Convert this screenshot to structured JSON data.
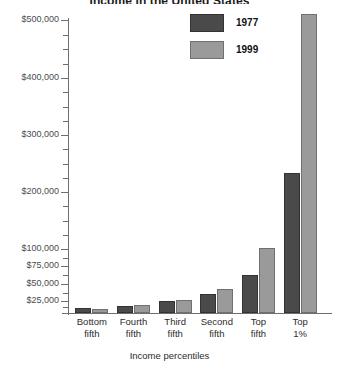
{
  "chart_data": {
    "type": "bar",
    "title": "Income in the United States",
    "xlabel": "Income percentiles",
    "ylabel": "",
    "categories": [
      "Bottom fifth",
      "Fourth fifth",
      "Third fifth",
      "Second fifth",
      "Top fifth",
      "Top 1%"
    ],
    "category_lines": [
      [
        "Bottom",
        "fifth"
      ],
      [
        "Fourth",
        "fifth"
      ],
      [
        "Third",
        "fifth"
      ],
      [
        "Second",
        "fifth"
      ],
      [
        "Top",
        "fifth"
      ],
      [
        "Top",
        "1%"
      ]
    ],
    "series": [
      {
        "name": "1977",
        "color": "#4a4a4a",
        "values": [
          10000,
          15000,
          24000,
          35000,
          63000,
          234000
        ]
      },
      {
        "name": "1999",
        "color": "#9a9a9a",
        "values": [
          9000,
          17000,
          26000,
          43000,
          102000,
          511000
        ]
      }
    ],
    "ytick_labels": [
      "$25,000",
      "$50,000",
      "$75,000",
      "$100,000",
      "$200,000",
      "$300,000",
      "$400,000",
      "$500,000"
    ],
    "ytick_values": [
      25000,
      50000,
      75000,
      100000,
      200000,
      300000,
      400000,
      500000
    ],
    "axis_note": "non-linear broken y-axis: compressed below $100,000",
    "ylim": [
      0,
      520000
    ],
    "grid": false,
    "legend_position": "top-center"
  },
  "legend": {
    "entries": [
      {
        "label": "1977",
        "color": "#4a4a4a"
      },
      {
        "label": "1999",
        "color": "#9a9a9a"
      }
    ]
  },
  "colors": {
    "series_1977": "#4a4a4a",
    "series_1999": "#9a9a9a",
    "axis": "#6f6f6f",
    "text": "#2b2b2b",
    "background": "#ffffff"
  }
}
